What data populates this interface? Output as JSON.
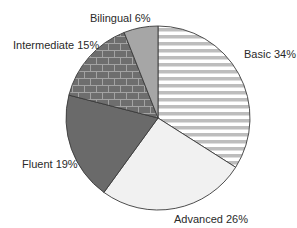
{
  "chart_data": {
    "type": "pie",
    "title": "",
    "start": "12 o'clock",
    "direction": "clockwise",
    "slices": [
      {
        "label": "Basic",
        "value": 34,
        "display": "Basic 34%",
        "fill": "horizontal-stripes",
        "colors": [
          "#bdbdbd",
          "#ffffff"
        ]
      },
      {
        "label": "Advanced",
        "value": 26,
        "display": "Advanced 26%",
        "fill": "solid",
        "colors": [
          "#f1f1f1"
        ]
      },
      {
        "label": "Fluent",
        "value": 19,
        "display": "Fluent 19%",
        "fill": "solid",
        "colors": [
          "#6a6a6a"
        ]
      },
      {
        "label": "Intermediate",
        "value": 15,
        "display": "Intermediate 15%",
        "fill": "brick",
        "colors": [
          "#6e6e6e",
          "#a3a3a3"
        ]
      },
      {
        "label": "Bilingual",
        "value": 6,
        "display": "Bilingual 6%",
        "fill": "solid",
        "colors": [
          "#a6a6a6"
        ]
      }
    ],
    "unit": "%",
    "legend": "none (labels beside slices)"
  }
}
